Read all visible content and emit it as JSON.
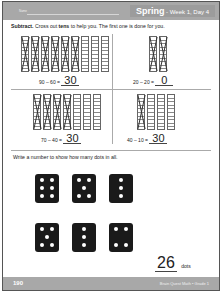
{
  "header": {
    "name_label": "Name",
    "season": "Spring",
    "week_day": " - Week 1, Day 4",
    "color": "#a8a8a8"
  },
  "section1": {
    "instruction_prefix": "Subtract.",
    "instruction_mid": " Cross out ",
    "instruction_bold": "tens",
    "instruction_suffix": " to help you. The first one is done for you.",
    "problems": [
      {
        "rods": 9,
        "crossed": 6,
        "equation": "90 – 60 =",
        "answer": "30"
      },
      {
        "rods": 2,
        "crossed": 2,
        "equation": "20 – 20 =",
        "answer": "0"
      },
      {
        "rods": 7,
        "crossed": 4,
        "equation": "70 – 40 =",
        "answer": "30"
      },
      {
        "rods": 4,
        "crossed": 1,
        "equation": "40 – 10 =",
        "answer": "30"
      }
    ]
  },
  "section2": {
    "instruction": "Write a number to show how many dots in all.",
    "dominoes": [
      6,
      5,
      3,
      5,
      3,
      4
    ],
    "total": "26",
    "unit": "dots"
  },
  "footer": {
    "page_number": "190",
    "book_title": "Brain Quest Math • Grade 1"
  }
}
